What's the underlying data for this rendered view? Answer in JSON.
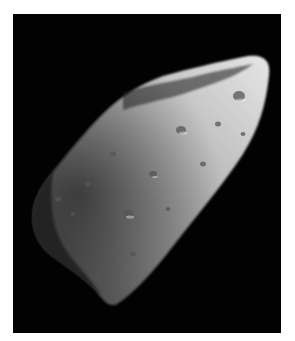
{
  "image": {
    "subject": "asteroid",
    "description": "Grayscale photograph of an elongated, heavily cratered asteroid lit from the upper right against a black space background",
    "colors": {
      "background": "#ffffff",
      "space": "#020202",
      "surface_light": "#d9d9d9",
      "surface_mid": "#8a8a8a",
      "surface_dark": "#2a2a2a"
    }
  }
}
